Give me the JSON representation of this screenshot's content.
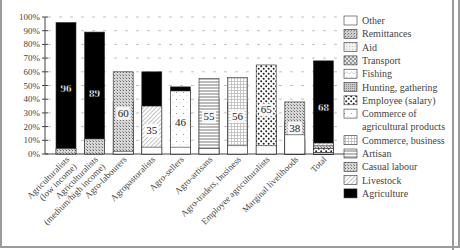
{
  "chart_data": {
    "type": "bar",
    "stacked": true,
    "title": "",
    "xlabel": "",
    "ylabel": "",
    "ylim": [
      0,
      100
    ],
    "yticks": [
      "0%",
      "10%",
      "20%",
      "30%",
      "40%",
      "50%",
      "60%",
      "70%",
      "80%",
      "90%",
      "100%"
    ],
    "grid": "dashed horizontal tick marks",
    "legend_position": "right",
    "categories": [
      "Agriculturalists (low income)",
      "Agriculturalists (medium/high income)",
      "Agro-labourers",
      "Agropastoralists",
      "Agro-sellers",
      "Agro-artisans",
      "Agro-traders, business",
      "Employee agriculturalists",
      "Marginal livelihoods",
      "Total"
    ],
    "category_label_lines": [
      [
        "Agriculturalists",
        "(low income)"
      ],
      [
        "Agriculturalists",
        "(medium/high income)"
      ],
      [
        "Agro-labourers"
      ],
      [
        "Agropastoralists"
      ],
      [
        "Agro-sellers"
      ],
      [
        "Agro-artisans"
      ],
      [
        "Agro-traders, business"
      ],
      [
        "Employee agriculturalists"
      ],
      [
        "Marginal livelihoods"
      ],
      [
        "Total"
      ]
    ],
    "series": [
      {
        "name": "Agriculture",
        "pattern": "solid-black",
        "values": [
          96,
          89,
          38,
          60,
          49,
          41,
          38,
          29,
          24,
          68
        ],
        "label_values": [
          96,
          89,
          38,
          60,
          49,
          41,
          38,
          29,
          24,
          68
        ]
      },
      {
        "name": "Livestock",
        "pattern": "diagonal",
        "values": [
          0,
          0,
          0,
          35,
          0,
          0,
          0,
          0,
          0,
          8
        ],
        "label_values": [
          null,
          null,
          null,
          35,
          null,
          null,
          null,
          null,
          null,
          null
        ]
      },
      {
        "name": "Casual labour",
        "pattern": "crosshatch-dots",
        "values": [
          4,
          11,
          60,
          0,
          0,
          0,
          0,
          0,
          38,
          6
        ],
        "label_values": [
          null,
          null,
          60,
          null,
          null,
          null,
          null,
          null,
          38,
          null
        ]
      },
      {
        "name": "Artisan",
        "pattern": "horizontal-lines",
        "values": [
          0,
          0,
          0,
          0,
          0,
          55,
          0,
          0,
          0,
          3
        ],
        "label_values": [
          null,
          null,
          null,
          null,
          null,
          55,
          null,
          null,
          null,
          null
        ]
      },
      {
        "name": "Commerce, business",
        "pattern": "grid",
        "values": [
          0,
          0,
          0,
          0,
          0,
          0,
          56,
          0,
          0,
          3
        ],
        "label_values": [
          null,
          null,
          null,
          null,
          null,
          null,
          56,
          null,
          null,
          null
        ]
      },
      {
        "name": "Commerce of agricultural products",
        "pattern": "sparse-dots",
        "values": [
          0,
          0,
          0,
          0,
          46,
          0,
          0,
          0,
          0,
          4
        ],
        "label_values": [
          null,
          null,
          null,
          null,
          46,
          null,
          null,
          null,
          null,
          null
        ]
      },
      {
        "name": "Employee (salary)",
        "pattern": "big-dots",
        "values": [
          0,
          0,
          0,
          0,
          0,
          0,
          0,
          65,
          0,
          4
        ],
        "label_values": [
          null,
          null,
          null,
          null,
          null,
          null,
          null,
          65,
          null,
          null
        ]
      },
      {
        "name": "Hunting, gathering",
        "pattern": "fine-dots",
        "values": [
          0,
          0,
          0,
          0,
          0,
          0,
          0,
          0,
          10,
          1
        ],
        "label_values": [
          null,
          null,
          null,
          null,
          null,
          null,
          null,
          null,
          null,
          null
        ]
      },
      {
        "name": "Fishing",
        "pattern": "light-sparse",
        "values": [
          0,
          0,
          0,
          0,
          0,
          0,
          0,
          0,
          0,
          0
        ],
        "label_values": [
          null,
          null,
          null,
          null,
          null,
          null,
          null,
          null,
          null,
          null
        ]
      },
      {
        "name": "Transport",
        "pattern": "checker",
        "values": [
          0,
          0,
          0,
          0,
          0,
          0,
          0,
          0,
          11,
          0
        ],
        "label_values": [
          null,
          null,
          null,
          null,
          null,
          null,
          null,
          null,
          null,
          null
        ]
      },
      {
        "name": "Aid",
        "pattern": "light-stipple",
        "values": [
          0,
          0,
          0,
          0,
          0,
          0,
          0,
          0,
          0,
          1
        ],
        "label_values": [
          null,
          null,
          null,
          null,
          null,
          null,
          null,
          null,
          null,
          null
        ]
      },
      {
        "name": "Remittances",
        "pattern": "medium-stipple",
        "values": [
          0,
          0,
          0,
          0,
          0,
          0,
          0,
          0,
          3,
          1
        ],
        "label_values": [
          null,
          null,
          null,
          null,
          null,
          null,
          null,
          null,
          null,
          null
        ]
      },
      {
        "name": "Other",
        "pattern": "white",
        "values": [
          0,
          0,
          2,
          5,
          5,
          4,
          6,
          6,
          14,
          1
        ],
        "label_values": [
          null,
          null,
          null,
          null,
          null,
          null,
          null,
          null,
          null,
          null
        ]
      }
    ],
    "legend": [
      {
        "name": "Other",
        "pattern": "white"
      },
      {
        "name": "Remittances",
        "pattern": "medium-stipple"
      },
      {
        "name": "Aid",
        "pattern": "light-stipple"
      },
      {
        "name": "Transport",
        "pattern": "checker"
      },
      {
        "name": "Fishing",
        "pattern": "light-sparse"
      },
      {
        "name": "Hunting, gathering",
        "pattern": "fine-dots"
      },
      {
        "name": "Employee (salary)",
        "pattern": "big-dots"
      },
      {
        "name": "Commerce of agricultural products",
        "pattern": "sparse-dots",
        "lines": [
          "Commerce of",
          "agricultural products"
        ]
      },
      {
        "name": "Commerce, business",
        "pattern": "grid"
      },
      {
        "name": "Artisan",
        "pattern": "horizontal-lines"
      },
      {
        "name": "Casual labour",
        "pattern": "crosshatch-dots"
      },
      {
        "name": "Livestock",
        "pattern": "diagonal"
      },
      {
        "name": "Agriculture",
        "pattern": "solid-black"
      }
    ]
  }
}
